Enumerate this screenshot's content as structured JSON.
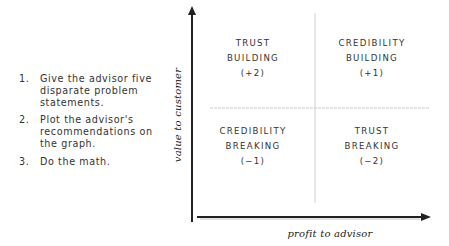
{
  "instructions": {
    "items": [
      {
        "number": "1.",
        "text": "Give the advisor five disparate problem statements."
      },
      {
        "number": "2.",
        "text": "Plot the advisor's recommendations on the graph."
      },
      {
        "number": "3.",
        "text": "Do the math."
      }
    ]
  },
  "graph": {
    "y_axis_label": "value to customer",
    "x_axis_label": "profit to advisor",
    "quadrants": {
      "top_left": {
        "line1": "TRUST",
        "line2": "BUILDING",
        "score": "(+2)"
      },
      "top_right": {
        "line1": "CREDIBILITY",
        "line2": "BUILDING",
        "score": "(+1)"
      },
      "bottom_left": {
        "line1": "CREDIBILITY",
        "line2": "BREAKING",
        "score": "(−1)"
      },
      "bottom_right": {
        "line1": "TRUST",
        "line2": "BREAKING",
        "score": "(−2)"
      }
    },
    "colors": {
      "axis": "#222222",
      "divider": "#c8c8c8",
      "text": "#333333"
    }
  }
}
